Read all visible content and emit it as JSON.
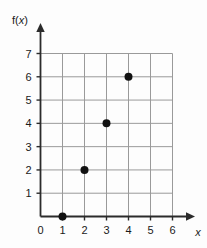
{
  "figure": {
    "name": "coordinate-grid-scatter-plot",
    "background_color": "#fdfdfd"
  },
  "chart_data": {
    "type": "scatter",
    "title": "",
    "subtitle": "",
    "xlabel": "x",
    "ylabel": "f(x)",
    "ylabel_parts": {
      "prefix": "f(",
      "variable": "x",
      "suffix": ")"
    },
    "x": [
      1,
      2,
      3,
      4
    ],
    "values": [
      0,
      2,
      4,
      6
    ],
    "points": [
      {
        "x": 1,
        "y": 0,
        "label": "(1, 0)"
      },
      {
        "x": 2,
        "y": 2,
        "label": "(2, 2)"
      },
      {
        "x": 3,
        "y": 4,
        "label": "(3, 4)"
      },
      {
        "x": 4,
        "y": 6,
        "label": "(4, 6)"
      }
    ],
    "xlim": [
      0,
      6
    ],
    "ylim": [
      0,
      7
    ],
    "xticks": [
      0,
      1,
      2,
      3,
      4,
      5,
      6
    ],
    "yticks": [
      1,
      2,
      3,
      4,
      5,
      6,
      7
    ],
    "xtick_labels": [
      "0",
      "1",
      "2",
      "3",
      "4",
      "5",
      "6"
    ],
    "ytick_labels": [
      "1",
      "2",
      "3",
      "4",
      "5",
      "6",
      "7"
    ],
    "origin_label": "0",
    "grid": true,
    "grid_color": "#9a9a9a",
    "axis_color": "#2b2b2b",
    "marker_color": "#111111",
    "marker_size": 4,
    "legend": null,
    "legend_position": "none",
    "annotations": []
  }
}
